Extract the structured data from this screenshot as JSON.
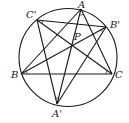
{
  "diagram": {
    "circle": {
      "cx": 68,
      "cy": 57.5,
      "r": 49
    },
    "points": {
      "A": {
        "label": "A",
        "x": 81,
        "y": 9,
        "lx": 78,
        "ly": 8
      },
      "B": {
        "label": "B",
        "x": 21,
        "y": 74,
        "lx": 11,
        "ly": 78
      },
      "C": {
        "label": "C",
        "x": 112,
        "y": 74,
        "lx": 115,
        "ly": 78
      },
      "A1": {
        "label": "A'",
        "x": 57,
        "y": 104,
        "lx": 52,
        "ly": 117
      },
      "B1": {
        "label": "B'",
        "x": 106,
        "y": 27,
        "lx": 110,
        "ly": 28
      },
      "C1": {
        "label": "C'",
        "x": 37,
        "y": 20,
        "lx": 26,
        "ly": 18
      },
      "P": {
        "label": "P",
        "x": 72,
        "y": 46,
        "lx": 74,
        "ly": 40
      }
    },
    "segments": [
      [
        "A",
        "B"
      ],
      [
        "A",
        "C"
      ],
      [
        "A",
        "A1"
      ],
      [
        "B",
        "C"
      ],
      [
        "B",
        "B1"
      ],
      [
        "C",
        "C1"
      ],
      [
        "C1",
        "B1"
      ],
      [
        "C1",
        "A1"
      ],
      [
        "B1",
        "A1"
      ]
    ],
    "stroke_color": "#1a1a1a"
  }
}
